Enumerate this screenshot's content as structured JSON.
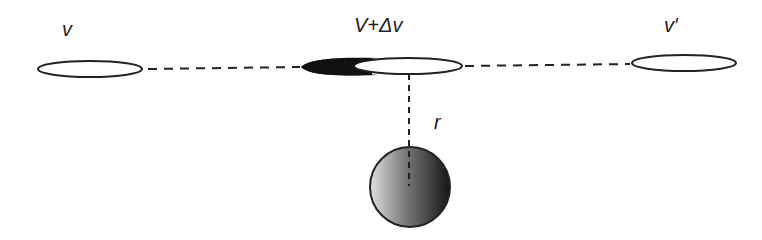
{
  "labels": {
    "v": "v",
    "v_mid": "V+Δv",
    "v_prime": "v′",
    "r": "r"
  },
  "colors": {
    "stroke": "#222222",
    "fill_dark": "#111111",
    "sphere_light": "#d8d8d8",
    "sphere_dark": "#1a1a1a"
  }
}
